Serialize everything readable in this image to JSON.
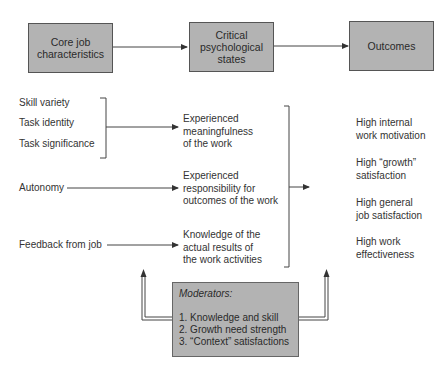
{
  "top_row": {
    "boxes": [
      {
        "label_line1": "Core job",
        "label_line2": "characteristics"
      },
      {
        "label_line1": "Critical",
        "label_line2": "psychological",
        "label_line3": "states"
      },
      {
        "label_line1": "Outcomes"
      }
    ]
  },
  "characteristics": {
    "group1": [
      "Skill variety",
      "Task identity",
      "Task significance"
    ],
    "autonomy": "Autonomy",
    "feedback": "Feedback from job"
  },
  "states": [
    [
      "Experienced",
      "meaningfulness",
      "of the work"
    ],
    [
      "Experienced",
      "responsibility for",
      "outcomes of the work"
    ],
    [
      "Knowledge of the",
      "actual results of",
      "the work activities"
    ]
  ],
  "outcomes": [
    [
      "High internal",
      "work motivation"
    ],
    [
      "High “growth”",
      "satisfaction"
    ],
    [
      "High general",
      "job satisfaction"
    ],
    [
      "High work",
      "effectiveness"
    ]
  ],
  "moderators": {
    "title": "Moderators:",
    "items": [
      "1. Knowledge and skill",
      "2. Growth need strength",
      "3. “Context” satisfactions"
    ]
  }
}
